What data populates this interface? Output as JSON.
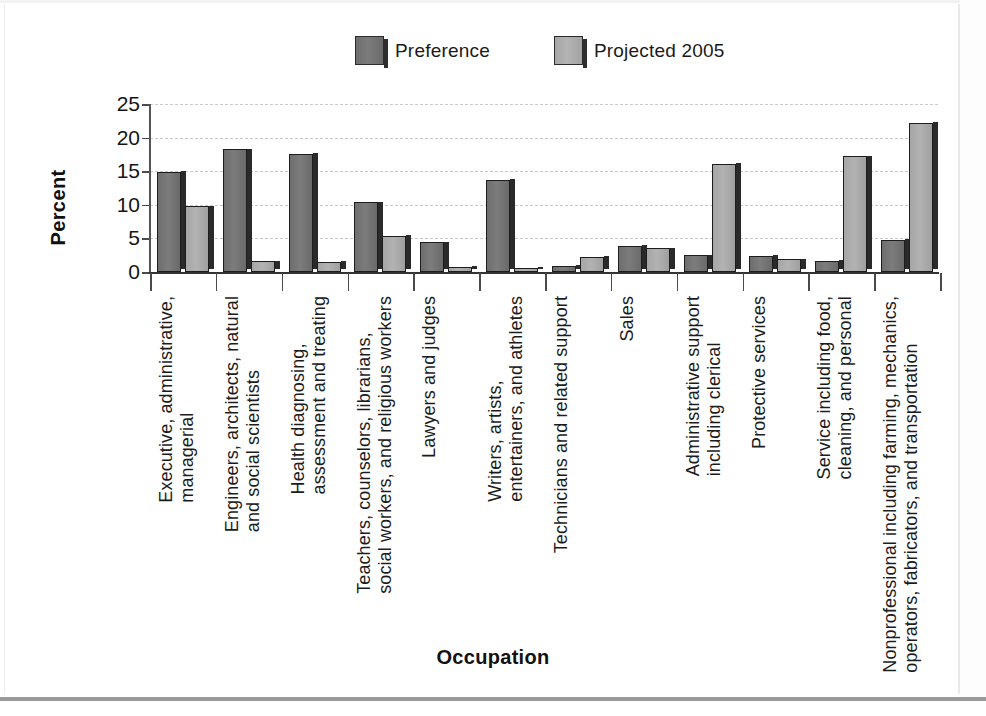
{
  "chart_data": {
    "type": "bar",
    "title": "",
    "xlabel": "Occupation",
    "ylabel": "Percent",
    "ylim": [
      0,
      25
    ],
    "yticks": [
      0,
      5,
      10,
      15,
      20,
      25
    ],
    "grid": true,
    "legend_position": "top-center",
    "categories": [
      "Executive, administrative,\nmanagerial",
      "Engineers, architects, natural\nand social scientists",
      "Health diagnosing,\nassessment and treating",
      "Teachers, counselors, librarians,\nsocial workers, and religious workers",
      "Lawyers and judges",
      "Writers, artists,\nentertainers, and athletes",
      "Technicians and related support",
      "Sales",
      "Administrative support\nincluding clerical",
      "Protective services",
      "Service including food,\ncleaning, and personal",
      "Nonprofessional including farming, mechanics,\noperators, fabricators, and transportation"
    ],
    "series": [
      {
        "name": "Preference",
        "color": "#6f6f6f",
        "values": [
          14.9,
          18.3,
          17.6,
          10.4,
          4.4,
          13.7,
          0.9,
          3.9,
          2.5,
          2.4,
          1.7,
          4.8
        ]
      },
      {
        "name": "Projected 2005",
        "color": "#a8a8a8",
        "values": [
          9.8,
          1.6,
          1.5,
          5.4,
          0.8,
          0.6,
          2.3,
          3.5,
          16.1,
          1.9,
          17.2,
          22.2
        ]
      }
    ]
  },
  "legend": {
    "entries": [
      {
        "label": "Preference"
      },
      {
        "label": "Projected 2005"
      }
    ]
  },
  "axes": {
    "y_title": "Percent",
    "x_title": "Occupation",
    "y_tick_labels": [
      "25",
      "20",
      "15",
      "10",
      "5",
      "0"
    ]
  }
}
